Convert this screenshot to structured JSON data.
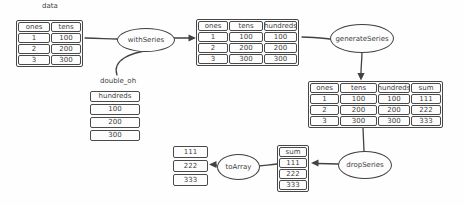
{
  "diagram": {
    "labels": {
      "data_table_label": "data",
      "double_oh_label": "double_oh"
    },
    "nodes": {
      "with_series": "withSeries",
      "generate_series": "generateSeries",
      "drop_series": "dropSeries",
      "to_array": "toArray"
    },
    "tables": {
      "data": {
        "headers": [
          "ones",
          "tens"
        ],
        "rows": [
          [
            "1",
            "100"
          ],
          [
            "2",
            "200"
          ],
          [
            "3",
            "300"
          ]
        ]
      },
      "with_hundreds": {
        "headers": [
          "ones",
          "tens",
          "hundreds"
        ],
        "rows": [
          [
            "1",
            "100",
            "100"
          ],
          [
            "2",
            "200",
            "200"
          ],
          [
            "3",
            "300",
            "300"
          ]
        ]
      },
      "with_sum": {
        "headers": [
          "ones",
          "tens",
          "hundreds",
          "sum"
        ],
        "rows": [
          [
            "1",
            "100",
            "100",
            "111"
          ],
          [
            "2",
            "200",
            "200",
            "222"
          ],
          [
            "3",
            "300",
            "300",
            "333"
          ]
        ]
      },
      "double_oh": {
        "headers": [
          "hundreds"
        ],
        "rows": [
          [
            "100"
          ],
          [
            "200"
          ],
          [
            "300"
          ]
        ]
      },
      "sum_series": {
        "headers": [
          "sum"
        ],
        "rows": [
          [
            "111"
          ],
          [
            "222"
          ],
          [
            "333"
          ]
        ]
      },
      "array_values": {
        "rows": [
          [
            "111"
          ],
          [
            "222"
          ],
          [
            "333"
          ]
        ]
      }
    },
    "colors": {
      "stroke": "#424242",
      "text": "#3a3a3a",
      "background": "#fefefe"
    }
  }
}
